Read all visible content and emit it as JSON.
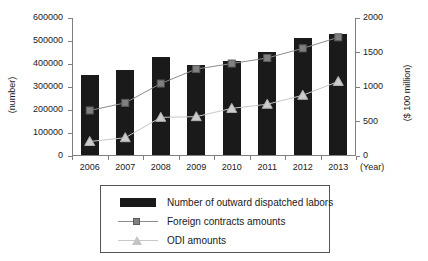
{
  "chart_data": {
    "type": "bar",
    "title": "",
    "xlabel": "(Year)",
    "ylabel": "(number)",
    "ylabel_right": "($ 100 million)",
    "categories": [
      "2006",
      "2007",
      "2008",
      "2009",
      "2010",
      "2011",
      "2012",
      "2013"
    ],
    "ylim": [
      0,
      600000
    ],
    "ylim_right": [
      0,
      2000
    ],
    "yticks": [
      "0",
      "100000",
      "200000",
      "300000",
      "400000",
      "500000",
      "600000"
    ],
    "ytick_values": [
      0,
      100000,
      200000,
      300000,
      400000,
      500000,
      600000
    ],
    "yticks_right": [
      "0",
      "500",
      "1000",
      "1500",
      "2000"
    ],
    "ytick_values_right": [
      0,
      500,
      1000,
      1500,
      2000
    ],
    "grid": false,
    "legend_position": "below-center",
    "series": [
      {
        "name": "Number of outward dispatched labors",
        "kind": "bar",
        "axis": "left",
        "color": "#1a1a1a",
        "values": [
          350000,
          370000,
          425000,
          390000,
          410000,
          450000,
          510000,
          527000
        ]
      },
      {
        "name": "Foreign contracts amounts",
        "kind": "line",
        "axis": "right",
        "color": "#8c8c8c",
        "marker": "square",
        "values": [
          660,
          770,
          1050,
          1260,
          1340,
          1420,
          1560,
          1720
        ]
      },
      {
        "name": "ODI amounts",
        "kind": "line",
        "axis": "right",
        "color": "#c8c8c8",
        "marker": "triangle",
        "values": [
          210,
          265,
          560,
          570,
          690,
          750,
          880,
          1080
        ]
      }
    ]
  },
  "legend": {
    "items": [
      {
        "label": "Number of outward dispatched labors",
        "key": "bar-swatch"
      },
      {
        "label": "Foreign contracts amounts",
        "key": "line-square-marker"
      },
      {
        "label": "ODI amounts",
        "key": "line-triangle-marker"
      }
    ]
  }
}
